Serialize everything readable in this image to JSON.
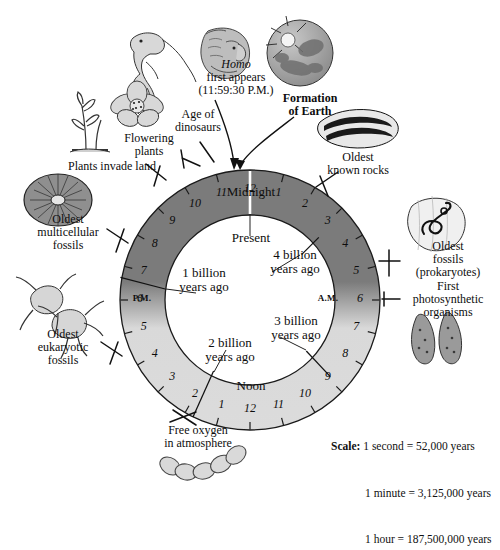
{
  "diagram": {
    "center_inner": [
      {
        "id": "present",
        "label": "Present"
      },
      {
        "id": "four-billion",
        "label": "4 billion\nyears ago"
      },
      {
        "id": "three-billion",
        "label": "3 billion\nyears ago"
      },
      {
        "id": "two-billion",
        "label": "2 billion\nyears ago"
      },
      {
        "id": "one-billion",
        "label": "1 billion\nyears ago"
      }
    ],
    "ring": {
      "midnight_label": "Midnight",
      "noon_label": "Noon",
      "pm_label": "P.M.",
      "am_label": "A.M.",
      "hours_am": [
        "12",
        "1",
        "2",
        "3",
        "4",
        "5",
        "6",
        "7",
        "8",
        "9",
        "10",
        "11"
      ],
      "hours_pm": [
        "12",
        "1",
        "2",
        "3",
        "4",
        "5",
        "6",
        "7",
        "8",
        "9",
        "10",
        "11"
      ],
      "dark_color": "#7b7b7b",
      "light_color": "#dcdcdc"
    },
    "callouts": [
      {
        "id": "homo",
        "lines": [
          "Homo",
          "first appears",
          "(11:59:30 P.M.)"
        ],
        "italic_first": true
      },
      {
        "id": "age-of-dinosaurs",
        "lines": [
          "Age of",
          "dinosaurs"
        ]
      },
      {
        "id": "flowering-plants",
        "lines": [
          "Flowering",
          "plants"
        ]
      },
      {
        "id": "plants-invade-land",
        "lines": [
          "Plants invade land"
        ]
      },
      {
        "id": "oldest-multicellular-fossils",
        "lines": [
          "Oldest",
          "multicellular",
          "fossils"
        ]
      },
      {
        "id": "oldest-eukaryotic-fossils",
        "lines": [
          "Oldest",
          "eukaryotic",
          "fossils"
        ]
      },
      {
        "id": "free-oxygen",
        "lines": [
          "Free oxygen",
          "in atmosphere"
        ]
      },
      {
        "id": "formation-of-earth",
        "lines": [
          "Formation",
          "of Earth"
        ],
        "bold": true
      },
      {
        "id": "oldest-known-rocks",
        "lines": [
          "Oldest",
          "known rocks"
        ]
      },
      {
        "id": "oldest-fossils-prokaryotes",
        "lines": [
          "Oldest",
          "fossils",
          "(prokaryotes)"
        ]
      },
      {
        "id": "first-photosynthetic-organisms",
        "lines": [
          "First",
          "photosynthetic",
          "organisms"
        ]
      }
    ],
    "scale": {
      "heading": "Scale:",
      "rows": [
        "1 second = 52,000 years",
        "1 minute = 3,125,000 years",
        "1 hour = 187,500,000 years"
      ]
    }
  },
  "chart_data": {
    "type": "pie",
    "annotations": [
      "Present",
      "4 billion years ago",
      "3 billion years ago",
      "2 billion years ago",
      "1 billion years ago",
      "Midnight",
      "Noon",
      "P.M.",
      "A.M."
    ],
    "legend_position": "none",
    "grid": false,
    "events": [
      {
        "label": "Formation of Earth",
        "clock": "12:00 Midnight (start)",
        "hour_angle_deg": 75
      },
      {
        "label": "Oldest known rocks",
        "clock": "about 1:30 A.M.",
        "hour_angle_deg": 45
      },
      {
        "label": "Oldest fossils (prokaryotes)",
        "clock": "about 5:00 A.M.",
        "hour_angle_deg": -60
      },
      {
        "label": "First photosynthetic organisms",
        "clock": "about 6:00 A.M.",
        "hour_angle_deg": -90
      },
      {
        "label": "Free oxygen in atmosphere",
        "clock": "about 1:30 P.M.",
        "hour_angle_deg": 255
      },
      {
        "label": "Oldest eukaryotic fossils",
        "clock": "about 4:30 P.M.",
        "hour_angle_deg": 215
      },
      {
        "label": "Oldest multicellular fossils",
        "clock": "about 8:00 P.M.",
        "hour_angle_deg": 150
      },
      {
        "label": "Plants invade land",
        "clock": "about 9:45 P.M.",
        "hour_angle_deg": 130
      },
      {
        "label": "Flowering plants",
        "clock": "about 11:00 P.M.",
        "hour_angle_deg": 105
      },
      {
        "label": "Age of dinosaurs",
        "clock": "about 11:15 P.M.",
        "hour_angle_deg": 98
      },
      {
        "label": "Homo first appears",
        "clock": "11:59:30 P.M.",
        "hour_angle_deg": 90
      }
    ],
    "scale_conversions": [
      {
        "unit": "1 second",
        "years": 52000
      },
      {
        "unit": "1 minute",
        "years": 3125000
      },
      {
        "unit": "1 hour",
        "years": 187500000
      }
    ],
    "ring_markers": {
      "four_billion_years_ago_at": "~2:40 A.M.",
      "three_billion_years_ago_at": "~7:40 A.M.",
      "two_billion_years_ago_at": "~12:50 P.M.",
      "one_billion_years_ago_at": "~6:20 P.M."
    }
  }
}
